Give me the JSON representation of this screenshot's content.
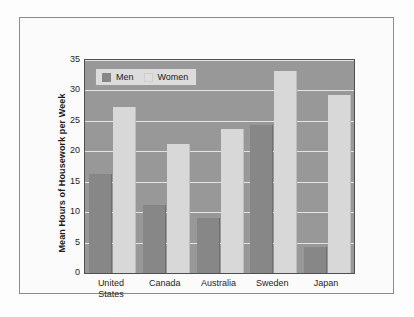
{
  "chart_data": {
    "type": "bar",
    "title": "",
    "xlabel": "",
    "ylabel": "Mean Hours of Housework per Week",
    "categories": [
      "United\nStates",
      "Canada",
      "Australia",
      "Sweden",
      "Japan"
    ],
    "series": [
      {
        "name": "Men",
        "values": [
          16.2,
          11.2,
          9.0,
          24.4,
          4.3
        ],
        "color": "#878787"
      },
      {
        "name": "Women",
        "values": [
          27.2,
          21.2,
          23.7,
          33.2,
          29.2
        ],
        "color": "#d8d8d8"
      }
    ],
    "ylim": [
      0,
      35
    ],
    "yticks": [
      0,
      5,
      10,
      15,
      20,
      25,
      30,
      35
    ],
    "ytick_labels": [
      "0",
      "5",
      "10",
      "15",
      "20",
      "25",
      "30",
      "35"
    ],
    "grid": true,
    "legend_position": "top-left",
    "plot_background": "#989898",
    "gridline_color": "#e9e9e9"
  }
}
